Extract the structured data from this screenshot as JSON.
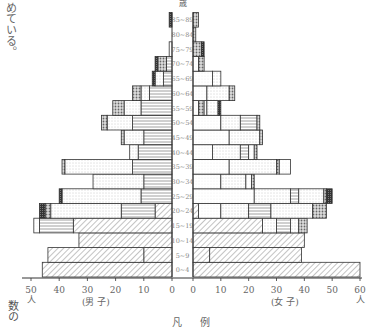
{
  "side_text_top": "めている。",
  "side_text_bottom": "数の",
  "legend_title": "凡例",
  "chart_data": {
    "type": "bar",
    "subtype": "population-pyramid",
    "title": "",
    "age_axis_label": "歳",
    "xlabel_male": "(男 子)",
    "xlabel_female": "(女 子)",
    "unit": "人",
    "male_ticks": [
      50,
      40,
      30,
      20,
      10,
      0
    ],
    "female_ticks": [
      0,
      10,
      20,
      30,
      40,
      50,
      60
    ],
    "xlim_male": [
      0,
      50
    ],
    "xlim_female": [
      0,
      60
    ],
    "grid": false,
    "categories": [
      "0~4",
      "5~9",
      "10~14",
      "15~19",
      "20~24",
      "25~29",
      "30~34",
      "35~39",
      "40~44",
      "45~49",
      "50~54",
      "55~59",
      "60~64",
      "65~69",
      "70~74",
      "75~79",
      "80~84",
      "85~89"
    ],
    "segment_types": [
      "hatched",
      "horizontal-lines",
      "dotted",
      "crosshatch",
      "dark"
    ],
    "male": [
      {
        "age": "0~4",
        "segments": [
          {
            "type": "hatched",
            "value": 46
          }
        ]
      },
      {
        "age": "5~9",
        "segments": [
          {
            "type": "hatched",
            "value": 10
          },
          {
            "type": "hatched",
            "value": 34
          }
        ]
      },
      {
        "age": "10~14",
        "segments": [
          {
            "type": "hatched",
            "value": 33
          }
        ]
      },
      {
        "age": "15~19",
        "segments": [
          {
            "type": "hatched",
            "value": 35
          },
          {
            "type": "horizontal-lines",
            "value": 12
          },
          {
            "type": "plain",
            "value": 2
          }
        ]
      },
      {
        "age": "20~24",
        "segments": [
          {
            "type": "hatched",
            "value": 6
          },
          {
            "type": "horizontal-lines",
            "value": 12
          },
          {
            "type": "dotted",
            "value": 25
          },
          {
            "type": "crosshatch",
            "value": 2
          },
          {
            "type": "dark",
            "value": 2
          }
        ]
      },
      {
        "age": "25~29",
        "segments": [
          {
            "type": "horizontal-lines",
            "value": 11
          },
          {
            "type": "dotted",
            "value": 28
          },
          {
            "type": "dark",
            "value": 1
          }
        ]
      },
      {
        "age": "30~34",
        "segments": [
          {
            "type": "horizontal-lines",
            "value": 10
          },
          {
            "type": "dotted",
            "value": 18
          }
        ]
      },
      {
        "age": "35~39",
        "segments": [
          {
            "type": "horizontal-lines",
            "value": 14
          },
          {
            "type": "dotted",
            "value": 24
          },
          {
            "type": "crosshatch",
            "value": 1
          }
        ]
      },
      {
        "age": "40~44",
        "segments": [
          {
            "type": "horizontal-lines",
            "value": 12
          },
          {
            "type": "dotted",
            "value": 3
          }
        ]
      },
      {
        "age": "45~49",
        "segments": [
          {
            "type": "horizontal-lines",
            "value": 10
          },
          {
            "type": "dotted",
            "value": 7
          },
          {
            "type": "crosshatch",
            "value": 1
          }
        ]
      },
      {
        "age": "50~54",
        "segments": [
          {
            "type": "horizontal-lines",
            "value": 14
          },
          {
            "type": "dotted",
            "value": 9
          },
          {
            "type": "crosshatch",
            "value": 2
          }
        ]
      },
      {
        "age": "55~59",
        "segments": [
          {
            "type": "horizontal-lines",
            "value": 11
          },
          {
            "type": "dotted",
            "value": 6
          },
          {
            "type": "crosshatch",
            "value": 4
          }
        ]
      },
      {
        "age": "60~64",
        "segments": [
          {
            "type": "horizontal-lines",
            "value": 8
          },
          {
            "type": "dotted",
            "value": 3
          },
          {
            "type": "crosshatch",
            "value": 3
          }
        ]
      },
      {
        "age": "65~69",
        "segments": [
          {
            "type": "horizontal-lines",
            "value": 3
          },
          {
            "type": "dotted",
            "value": 3
          },
          {
            "type": "dark",
            "value": 1
          }
        ]
      },
      {
        "age": "70~74",
        "segments": [
          {
            "type": "horizontal-lines",
            "value": 2
          },
          {
            "type": "crosshatch",
            "value": 3
          },
          {
            "type": "dark",
            "value": 1
          }
        ]
      },
      {
        "age": "75~79",
        "segments": [
          {
            "type": "plain",
            "value": 1
          }
        ]
      },
      {
        "age": "80~84",
        "segments": []
      },
      {
        "age": "85~89",
        "segments": [
          {
            "type": "dark",
            "value": 1
          }
        ]
      }
    ],
    "female": [
      {
        "age": "0~4",
        "segments": [
          {
            "type": "hatched",
            "value": 60
          }
        ]
      },
      {
        "age": "5~9",
        "segments": [
          {
            "type": "hatched",
            "value": 6
          },
          {
            "type": "hatched",
            "value": 33
          }
        ]
      },
      {
        "age": "10~14",
        "segments": [
          {
            "type": "hatched",
            "value": 40
          }
        ]
      },
      {
        "age": "15~19",
        "segments": [
          {
            "type": "hatched",
            "value": 25
          },
          {
            "type": "dotted",
            "value": 5
          },
          {
            "type": "horizontal-lines",
            "value": 5
          },
          {
            "type": "dotted",
            "value": 3
          },
          {
            "type": "crosshatch",
            "value": 3
          }
        ]
      },
      {
        "age": "20~24",
        "segments": [
          {
            "type": "hatched",
            "value": 2
          },
          {
            "type": "plain",
            "value": 8
          },
          {
            "type": "dotted",
            "value": 10
          },
          {
            "type": "horizontal-lines",
            "value": 8
          },
          {
            "type": "dotted",
            "value": 15
          },
          {
            "type": "crosshatch",
            "value": 5
          }
        ]
      },
      {
        "age": "25~29",
        "segments": [
          {
            "type": "plain",
            "value": 22
          },
          {
            "type": "dotted",
            "value": 13
          },
          {
            "type": "horizontal-lines",
            "value": 3
          },
          {
            "type": "dotted",
            "value": 9
          },
          {
            "type": "crosshatch",
            "value": 1
          },
          {
            "type": "dark",
            "value": 2
          }
        ]
      },
      {
        "age": "30~34",
        "segments": [
          {
            "type": "plain",
            "value": 10
          },
          {
            "type": "dotted",
            "value": 9
          },
          {
            "type": "plain",
            "value": 2
          },
          {
            "type": "crosshatch",
            "value": 1
          }
        ]
      },
      {
        "age": "35~39",
        "segments": [
          {
            "type": "plain",
            "value": 13
          },
          {
            "type": "dotted",
            "value": 17
          },
          {
            "type": "crosshatch",
            "value": 1
          },
          {
            "type": "plain",
            "value": 4
          }
        ]
      },
      {
        "age": "40~44",
        "segments": [
          {
            "type": "plain",
            "value": 7
          },
          {
            "type": "dotted",
            "value": 10
          },
          {
            "type": "horizontal-lines",
            "value": 3
          },
          {
            "type": "plain",
            "value": 2
          },
          {
            "type": "crosshatch",
            "value": 1
          }
        ]
      },
      {
        "age": "45~49",
        "segments": [
          {
            "type": "plain",
            "value": 13
          },
          {
            "type": "dotted",
            "value": 11
          },
          {
            "type": "crosshatch",
            "value": 1
          }
        ]
      },
      {
        "age": "50~54",
        "segments": [
          {
            "type": "plain",
            "value": 10
          },
          {
            "type": "dotted",
            "value": 7
          },
          {
            "type": "horizontal-lines",
            "value": 6
          },
          {
            "type": "crosshatch",
            "value": 1
          }
        ]
      },
      {
        "age": "55~59",
        "segments": [
          {
            "type": "plain",
            "value": 2
          },
          {
            "type": "crosshatch",
            "value": 2
          },
          {
            "type": "plain",
            "value": 1
          },
          {
            "type": "dotted",
            "value": 4
          },
          {
            "type": "dark",
            "value": 1
          }
        ]
      },
      {
        "age": "60~64",
        "segments": [
          {
            "type": "plain",
            "value": 5
          },
          {
            "type": "dotted",
            "value": 8
          },
          {
            "type": "crosshatch",
            "value": 2
          }
        ]
      },
      {
        "age": "65~69",
        "segments": [
          {
            "type": "plain",
            "value": 7
          },
          {
            "type": "dotted",
            "value": 3
          }
        ]
      },
      {
        "age": "70~74",
        "segments": [
          {
            "type": "plain",
            "value": 2
          },
          {
            "type": "crosshatch",
            "value": 2
          }
        ]
      },
      {
        "age": "75~79",
        "segments": [
          {
            "type": "crosshatch",
            "value": 3
          },
          {
            "type": "dark",
            "value": 1
          }
        ]
      },
      {
        "age": "80~84",
        "segments": [
          {
            "type": "crosshatch",
            "value": 1
          }
        ]
      },
      {
        "age": "85~89",
        "segments": [
          {
            "type": "crosshatch",
            "value": 2
          }
        ]
      }
    ]
  }
}
